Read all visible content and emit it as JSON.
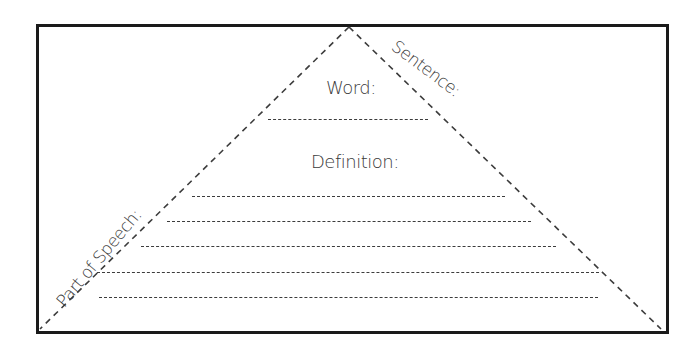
{
  "worksheet": {
    "title": "Vocabulary Triangle",
    "labels": {
      "word": "Word:",
      "definition": "Definition:",
      "sentence": "Sentence:",
      "part_of_speech": "Part of Speech:"
    },
    "word_line": {
      "x1": 268,
      "x2": 428,
      "y": 119
    },
    "definition_lines": [
      {
        "x1": 192,
        "x2": 505,
        "y": 196
      },
      {
        "x1": 167,
        "x2": 531,
        "y": 221
      },
      {
        "x1": 141,
        "x2": 556,
        "y": 246
      },
      {
        "x1": 97,
        "x2": 599,
        "y": 272
      },
      {
        "x1": 99,
        "x2": 598,
        "y": 297
      }
    ],
    "triangle": {
      "apex": [
        349,
        27
      ],
      "left_base": [
        40,
        329
      ],
      "right_base": [
        661,
        329
      ]
    },
    "colors": {
      "border": "#1a1a1a",
      "dash": "#3c3c3c",
      "text": "#3a3a3a",
      "background": "#ffffff"
    }
  }
}
